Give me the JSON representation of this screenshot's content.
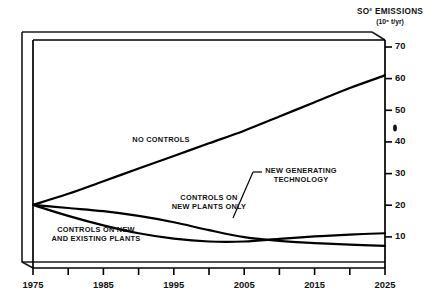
{
  "chart_data": {
    "type": "line",
    "title_display": "SO² EMISSIONS",
    "units": "(10⁶ t/yr)",
    "xlabel": "",
    "ylabel": "SO² EMISSIONS (10⁶ t/yr)",
    "xlim": [
      1975,
      2025
    ],
    "ylim": [
      0,
      70
    ],
    "grid": false,
    "legend_position": "inline-annotations",
    "x_ticks": [
      1975,
      1985,
      1995,
      2005,
      2015,
      2025
    ],
    "x_minor_ticks": [
      1980,
      1990,
      2000,
      2010,
      2020
    ],
    "y_ticks": [
      10,
      20,
      30,
      40,
      50,
      60,
      70
    ],
    "x_tick_labels": [
      "1975",
      "1985",
      "1995",
      "2005",
      "2015",
      "2025"
    ],
    "y_tick_labels": [
      "10",
      "20",
      "30",
      "40",
      "50",
      "60",
      "70"
    ],
    "x": [
      1975,
      1980,
      1985,
      1990,
      1995,
      2000,
      2005,
      2010,
      2015,
      2020,
      2025
    ],
    "series": [
      {
        "name": "NO CONTROLS",
        "label": "NO CONTROLS",
        "values": [
          20.0,
          23.5,
          27.5,
          31.5,
          35.5,
          39.5,
          43.5,
          48.0,
          52.5,
          57.0,
          61.0
        ]
      },
      {
        "name": "CONTROLS ON NEW PLANTS ONLY",
        "label": "CONTROLS ON NEW PLANTS ONLY",
        "values": [
          20.0,
          19.0,
          18.0,
          16.5,
          14.5,
          12.0,
          9.8,
          8.6,
          7.9,
          7.4,
          7.0
        ]
      },
      {
        "name": "CONTROLS ON NEW AND EXISTING PLANTS",
        "label": "CONTROLS ON NEW AND EXISTING PLANTS",
        "values": [
          20.0,
          16.5,
          13.5,
          11.0,
          9.3,
          8.4,
          8.4,
          9.2,
          10.0,
          10.6,
          11.0
        ]
      }
    ],
    "annotations": [
      {
        "name": "no-controls",
        "text": "NO CONTROLS",
        "lines": [
          "NO CONTROLS"
        ],
        "x": 161,
        "y": 139
      },
      {
        "name": "controls-new-plants-only",
        "text": "CONTROLS ON NEW PLANTS ONLY",
        "lines": [
          "CONTROLS ON",
          "NEW PLANTS ONLY"
        ],
        "x": 209,
        "y": 203
      },
      {
        "name": "new-generating-technology",
        "text": "NEW GENERATING TECHNOLOGY",
        "lines": [
          "NEW GENERATING",
          "TECHNOLOGY"
        ],
        "x": 288,
        "y": 176,
        "leader": true
      },
      {
        "name": "controls-new-and-existing-plants",
        "text": "CONTROLS ON NEW AND EXISTING PLANTS",
        "lines": [
          "CONTROLS ON NEW",
          "AND EXISTING PLANTS"
        ],
        "x": 96,
        "y": 231
      }
    ],
    "colors": {
      "line": "#000000",
      "axis": "#000000",
      "background": "#ffffff",
      "frame": "#1a1a1a"
    }
  }
}
